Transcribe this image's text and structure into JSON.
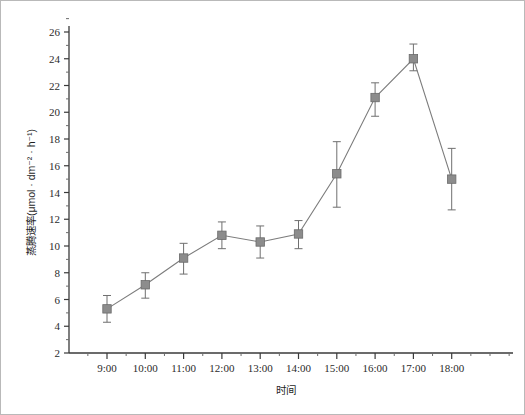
{
  "chart_data": {
    "type": "line",
    "title": "",
    "xlabel": "时间",
    "ylabel": "蒸腾速率(μmol · dm⁻² · h⁻¹)",
    "categories": [
      "9:00",
      "10:00",
      "11:00",
      "12:00",
      "13:00",
      "14:00",
      "15:00",
      "16:00",
      "17:00",
      "18:00"
    ],
    "values": [
      5.3,
      7.1,
      9.1,
      10.8,
      10.3,
      10.9,
      15.4,
      21.1,
      24.0,
      15.0
    ],
    "errors_upper": [
      1.0,
      0.9,
      1.1,
      1.0,
      1.2,
      1.0,
      2.4,
      1.1,
      1.1,
      2.3
    ],
    "errors_lower": [
      1.0,
      1.0,
      1.2,
      1.0,
      1.2,
      1.1,
      2.5,
      1.4,
      0.9,
      2.3
    ],
    "ylim": [
      2,
      26
    ],
    "ytick_labels": [
      "2",
      "4",
      "6",
      "8",
      "10",
      "12",
      "14",
      "16",
      "18",
      "20",
      "22",
      "24",
      "26"
    ],
    "ytick_values": [
      2,
      4,
      6,
      8,
      10,
      12,
      14,
      16,
      18,
      20,
      22,
      24,
      26
    ],
    "minor_ticks": true,
    "grid": false,
    "legend": "none",
    "series": [
      {
        "name": "蒸腾速率",
        "values": [
          5.3,
          7.1,
          9.1,
          10.8,
          10.3,
          10.9,
          15.4,
          21.1,
          24.0,
          15.0
        ]
      }
    ],
    "marker_color": "#8c8c8c",
    "line_color": "#7c7c7c",
    "errorbar_color": "#6f6f6f"
  },
  "axis": {
    "y_label_text": "蒸腾速率(μmol · dm⁻² · h⁻¹)",
    "x_label_text": "时间"
  }
}
